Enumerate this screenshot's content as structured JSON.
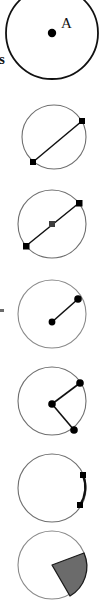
{
  "document": {
    "title": "Circle parts diagram strip",
    "background_color": "#ffffff",
    "cropped_text_fragment": "s"
  },
  "palette": {
    "stroke_dark": "#111111",
    "stroke_light": "#6f6f6f",
    "point_fill": "#000000",
    "sector_fill": "#6b6b6b",
    "sector_stroke": "#1a1a1a"
  },
  "figures": [
    {
      "name": "circle-with-center-point",
      "concept": "center",
      "center_label": "A",
      "stroke_color": "#111111",
      "stroke_width": 1.8,
      "cropped": true,
      "points": [
        {
          "name": "center",
          "label": "A"
        }
      ]
    },
    {
      "name": "circle-with-chord",
      "concept": "chord",
      "stroke_color": "#6f6f6f",
      "stroke_width": 1.1,
      "cropped": false,
      "points": [
        {
          "name": "chord-endpoint-upper-right",
          "label": ""
        },
        {
          "name": "chord-endpoint-lower-left",
          "label": ""
        }
      ]
    },
    {
      "name": "circle-with-diameter",
      "concept": "diameter",
      "stroke_color": "#6f6f6f",
      "stroke_width": 1.1,
      "cropped": false,
      "points": [
        {
          "name": "diameter-endpoint-upper-right",
          "label": ""
        },
        {
          "name": "diameter-center",
          "label": ""
        },
        {
          "name": "diameter-endpoint-lower-left",
          "label": ""
        }
      ]
    },
    {
      "name": "circle-with-radius",
      "concept": "radius",
      "stroke_color": "#8a8a8a",
      "stroke_width": 1.1,
      "cropped": false,
      "points": [
        {
          "name": "radius-center",
          "label": ""
        },
        {
          "name": "radius-endpoint-upper-right",
          "label": ""
        }
      ]
    },
    {
      "name": "circle-with-central-angle",
      "concept": "central angle",
      "stroke_color": "#6f6f6f",
      "stroke_width": 1.1,
      "cropped": false,
      "points": [
        {
          "name": "angle-vertex-center",
          "label": ""
        },
        {
          "name": "angle-endpoint-upper-right",
          "label": ""
        },
        {
          "name": "angle-endpoint-lower-right",
          "label": ""
        }
      ]
    },
    {
      "name": "circle-with-arc",
      "concept": "arc",
      "stroke_color": "#6f6f6f",
      "stroke_width": 1.1,
      "cropped": false,
      "points": [
        {
          "name": "arc-endpoint-upper-right",
          "label": ""
        },
        {
          "name": "arc-endpoint-lower-right",
          "label": ""
        }
      ]
    },
    {
      "name": "circle-with-shaded-sector",
      "concept": "sector",
      "stroke_color": "#8a8a8a",
      "stroke_width": 1.1,
      "cropped": true,
      "shaded": true,
      "shade_color": "#6b6b6b",
      "points": []
    }
  ]
}
